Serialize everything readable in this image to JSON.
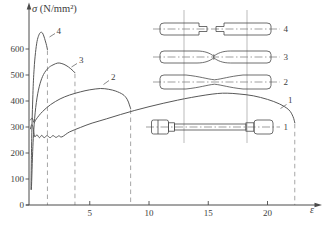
{
  "figure": {
    "bg": "#ffffff",
    "ink": "#4a4a4a",
    "curve_color": "#585858",
    "dash_color": "#9c9c9c",
    "gauge_color": "#8d8d8d",
    "text_color": "#3d3d3d"
  },
  "axes": {
    "sigma": "σ",
    "units": " (N/mm²)",
    "x_title": "ε",
    "y_ticks": [
      0,
      100,
      200,
      300,
      400,
      500,
      600
    ],
    "x_ticks": [
      5,
      10,
      15,
      20
    ]
  },
  "chart_data": {
    "type": "line",
    "xlabel": "ε",
    "ylabel": "σ (N/mm²)",
    "xlim": [
      0,
      24.5
    ],
    "ylim": [
      0,
      775
    ],
    "grid": false,
    "series": [
      {
        "name": "1",
        "fracture_strain": 22.3,
        "points": [
          [
            0,
            293
          ],
          [
            0.1,
            309
          ],
          [
            0.22,
            298
          ],
          [
            0.35,
            263
          ],
          [
            0.55,
            270
          ],
          [
            0.75,
            259
          ],
          [
            0.95,
            268
          ],
          [
            1.15,
            259
          ],
          [
            1.4,
            267
          ],
          [
            1.65,
            259
          ],
          [
            1.9,
            267
          ],
          [
            2.15,
            260
          ],
          [
            2.4,
            266
          ],
          [
            2.65,
            262
          ],
          [
            3.3,
            281
          ],
          [
            4.2,
            298
          ],
          [
            5.2,
            315
          ],
          [
            6.4,
            331
          ],
          [
            7.6,
            348
          ],
          [
            8.8,
            364
          ],
          [
            10,
            378
          ],
          [
            11.2,
            391
          ],
          [
            12.4,
            403
          ],
          [
            13.6,
            414
          ],
          [
            14.8,
            423
          ],
          [
            15.8,
            429
          ],
          [
            16.6,
            430
          ],
          [
            17.6,
            427
          ],
          [
            18.8,
            420
          ],
          [
            20,
            406
          ],
          [
            21,
            389
          ],
          [
            21.8,
            366
          ],
          [
            22.15,
            340
          ],
          [
            22.3,
            316
          ]
        ]
      },
      {
        "name": "2",
        "fracture_strain": 8.45,
        "points": [
          [
            0,
            327
          ],
          [
            0.15,
            334
          ],
          [
            0.3,
            317
          ],
          [
            0.5,
            331
          ],
          [
            1,
            359
          ],
          [
            1.7,
            386
          ],
          [
            2.5,
            408
          ],
          [
            3.3,
            423
          ],
          [
            4.2,
            435
          ],
          [
            5,
            443
          ],
          [
            5.9,
            448
          ],
          [
            6.6,
            445
          ],
          [
            7.2,
            438
          ],
          [
            7.8,
            425
          ],
          [
            8.15,
            407
          ],
          [
            8.35,
            385
          ],
          [
            8.45,
            371
          ]
        ]
      },
      {
        "name": "3",
        "fracture_strain": 3.75,
        "points": [
          [
            0.08,
            60
          ],
          [
            0.2,
            225
          ],
          [
            0.35,
            332
          ],
          [
            0.55,
            412
          ],
          [
            0.8,
            466
          ],
          [
            1.1,
            502
          ],
          [
            1.5,
            527
          ],
          [
            1.9,
            539
          ],
          [
            2.3,
            546
          ],
          [
            2.65,
            544
          ],
          [
            3.0,
            537
          ],
          [
            3.4,
            524
          ],
          [
            3.75,
            509
          ]
        ]
      },
      {
        "name": "4",
        "fracture_strain": 1.43,
        "points": [
          [
            0.04,
            60
          ],
          [
            0.1,
            255
          ],
          [
            0.2,
            425
          ],
          [
            0.3,
            522
          ],
          [
            0.42,
            586
          ],
          [
            0.55,
            629
          ],
          [
            0.7,
            653
          ],
          [
            0.85,
            664
          ],
          [
            1.0,
            662
          ],
          [
            1.12,
            650
          ],
          [
            1.25,
            631
          ],
          [
            1.36,
            613
          ],
          [
            1.43,
            598
          ]
        ]
      }
    ]
  },
  "specimens": {
    "labels": [
      "4",
      "3",
      "2",
      "1"
    ]
  }
}
